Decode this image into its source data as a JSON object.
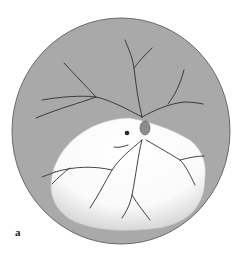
{
  "figure": {
    "panel_label": "a",
    "colors": {
      "fundus_background": "#a9a9a9",
      "fundus_outline": "#6a6a6a",
      "detached_area": "#ffffff",
      "vessel": "#2f2f2f",
      "page_background": "#ffffff"
    },
    "elements": [
      "fundus-circle",
      "retinal-vessels",
      "optic-disc",
      "detached-retina-region",
      "retinal-hole"
    ]
  }
}
